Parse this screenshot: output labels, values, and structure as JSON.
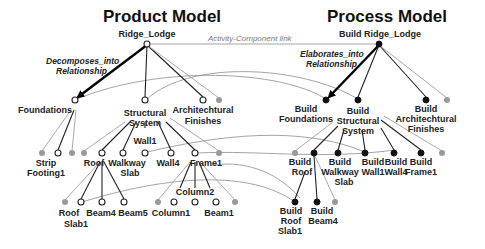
{
  "titles": {
    "product": "Product Model",
    "process": "Process Model"
  },
  "relations": {
    "decomposes_line1": "Decomposes_into",
    "decomposes_line2": "Relationship",
    "elaborates_line1": "Elaborates_into",
    "elaborates_line2": "Relationship",
    "activity_link": "Activity-Component link"
  },
  "product": {
    "root": "Ridge_Lodge",
    "foundations": "Foundations",
    "structural_1": "Structural",
    "structural_2": "System",
    "arch_1": "Architechtural",
    "arch_2": "Finishes",
    "strip_1": "Strip",
    "strip_2": "Footing1",
    "roof": "Roof",
    "walkway_1": "Walkway",
    "walkway_2": "Slab",
    "wall1": "Wall1",
    "wall4": "Wall4",
    "frame1": "Frame1",
    "roofslab_1": "Roof",
    "roofslab_2": "Slab1",
    "beam4": "Beam4",
    "beam5": "Beam5",
    "column1": "Column1",
    "column2": "Column2",
    "beam1": "Beam1"
  },
  "process": {
    "root": "Build Ridge_Lodge",
    "foundations_1": "Build",
    "foundations_2": "Foundations",
    "structural_1": "Build",
    "structural_2": "Structural",
    "structural_3": "System",
    "arch_1": "Build",
    "arch_2": "Architechtural",
    "arch_3": "Finishes",
    "roof_1": "Build",
    "roof_2": "Roof",
    "walkway_1": "Build",
    "walkway_2": "Walkway",
    "walkway_3": "Slab",
    "wall1_1": "Build",
    "wall1_2": "Wall1",
    "wall4_1": "Build",
    "wall4_2": "Wall4",
    "frame1_1": "Build",
    "frame1_2": "Frame1",
    "roofslab_1": "Build",
    "roofslab_2": "Roof",
    "roofslab_3": "Slab1",
    "beam4_1": "Build",
    "beam4_2": "Beam4"
  }
}
